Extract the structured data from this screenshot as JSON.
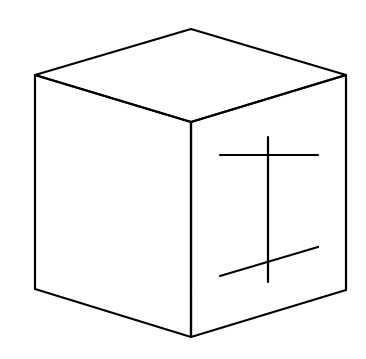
{
  "diagram": {
    "stroke_color": "#000000",
    "background": "#ffffff",
    "symbol_on_right_face": "vertical stroke crossed by a horizontal top bar and a slanted bottom bar"
  }
}
